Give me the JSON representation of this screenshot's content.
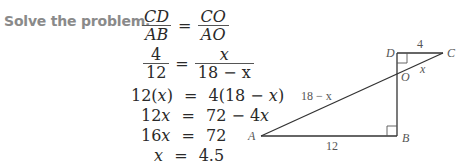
{
  "heading": "Solve the problem.",
  "proportion": {
    "left": {
      "num": "CD",
      "den": "AB"
    },
    "right": {
      "num": "CO",
      "den": "AO"
    }
  },
  "substitution": {
    "left": {
      "num": "4",
      "den": "12"
    },
    "right": {
      "num": "x",
      "den": "18 − x"
    }
  },
  "steps": [
    {
      "lhs": "12(x)",
      "rhs": "4(18 − x)"
    },
    {
      "lhs": "12x",
      "rhs": "72 − 4x"
    },
    {
      "lhs": "16x",
      "rhs": "72"
    },
    {
      "lhs": "x",
      "rhs": "4.5"
    }
  ],
  "equals": "=",
  "diagram": {
    "points": {
      "A": "A",
      "B": "B",
      "C": "C",
      "D": "D",
      "O": "O"
    },
    "segment_labels": {
      "AB": "12",
      "DC": "4",
      "OC": "x",
      "AO": "18 − x"
    }
  }
}
